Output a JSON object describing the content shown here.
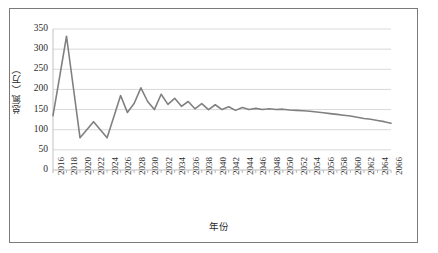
{
  "chart_data": {
    "type": "line",
    "title": "",
    "subtitle": "",
    "xlabel": "年份",
    "ylabel": "总氮（万）",
    "xlim": [
      2016,
      2066
    ],
    "ylim": [
      0,
      350
    ],
    "ytick_interval": 50,
    "xtick_interval": 2,
    "grid": "horizontal",
    "legend": "none",
    "line_color": "#808080",
    "yticks": [
      0,
      50,
      100,
      150,
      200,
      250,
      300,
      350
    ],
    "xticks": [
      2016,
      2018,
      2020,
      2022,
      2024,
      2026,
      2028,
      2030,
      2032,
      2034,
      2036,
      2038,
      2040,
      2042,
      2044,
      2046,
      2048,
      2050,
      2052,
      2054,
      2056,
      2058,
      2060,
      2062,
      2064,
      2066
    ],
    "series": [
      {
        "name": "总氮",
        "x": [
          2016,
          2017,
          2018,
          2019,
          2020,
          2021,
          2022,
          2023,
          2024,
          2025,
          2026,
          2027,
          2028,
          2029,
          2030,
          2031,
          2032,
          2033,
          2034,
          2035,
          2036,
          2037,
          2038,
          2039,
          2040,
          2041,
          2042,
          2043,
          2044,
          2045,
          2046,
          2047,
          2048,
          2049,
          2050,
          2051,
          2052,
          2053,
          2054,
          2055,
          2056,
          2057,
          2058,
          2059,
          2060,
          2061,
          2062,
          2063,
          2064,
          2065,
          2066
        ],
        "values": [
          135,
          233,
          332,
          206,
          80,
          100,
          120,
          100,
          80,
          132,
          185,
          143,
          165,
          204,
          170,
          150,
          188,
          163,
          178,
          158,
          170,
          152,
          165,
          150,
          162,
          150,
          157,
          148,
          155,
          150,
          153,
          150,
          152,
          150,
          151,
          149,
          148,
          147,
          146,
          144,
          142,
          140,
          138,
          136,
          134,
          131,
          128,
          126,
          123,
          120,
          116
        ]
      }
    ]
  }
}
